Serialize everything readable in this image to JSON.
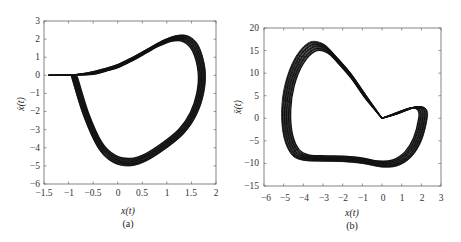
{
  "chart_data": [
    {
      "type": "line",
      "panel": "(a)",
      "caption": "(a)",
      "title": "",
      "xlabel": "x(t)",
      "ylabel": "ẋ(t)",
      "xlim": [
        -1.5,
        2
      ],
      "ylim": [
        -6,
        3
      ],
      "xticks": [
        "-1.5",
        "-1",
        "-0.5",
        "0",
        "0.5",
        "1",
        "1.5",
        "2"
      ],
      "yticks": [
        "3",
        "2",
        "1",
        "0",
        "-1",
        "-2",
        "-3",
        "-4",
        "-5",
        "-6"
      ],
      "grid": false,
      "description": "Phase portrait: trajectory starts at (-1.4, 0), runs along y=0 to about (-0.95, 0) then forms a banded chaotic-like loop reaching max ẋ≈2.3 near x≈1.3, max x≈1.8, min ẋ≈-5.1 near x≈0.25, returning to (-0.95, 0).",
      "series": [
        {
          "name": "trajectory",
          "x": [
            -1.4,
            -1.2,
            -0.95,
            -0.6,
            -0.3,
            0.0,
            0.3,
            0.6,
            0.9,
            1.2,
            1.45,
            1.65,
            1.78,
            1.75,
            1.6,
            1.35,
            1.0,
            0.6,
            0.25,
            -0.1,
            -0.4,
            -0.7,
            -0.95
          ],
          "y": [
            0.0,
            0.0,
            0.02,
            0.15,
            0.35,
            0.6,
            1.0,
            1.45,
            1.9,
            2.2,
            2.15,
            1.6,
            0.3,
            -1.0,
            -2.2,
            -3.2,
            -4.0,
            -4.7,
            -5.0,
            -4.8,
            -4.0,
            -2.2,
            0.0
          ]
        }
      ]
    },
    {
      "type": "line",
      "panel": "(b)",
      "caption": "(b)",
      "title": "",
      "xlabel": "x(t)",
      "ylabel": "ẍ(t)",
      "xlim": [
        -6,
        3
      ],
      "ylim": [
        -15,
        20
      ],
      "xticks": [
        "-6",
        "-5",
        "-4",
        "-3",
        "-2",
        "-1",
        "0",
        "1",
        "2",
        "3"
      ],
      "yticks": [
        "20",
        "15",
        "10",
        "5",
        "0",
        "-5",
        "-10",
        "-15"
      ],
      "grid": false,
      "description": "Phase portrait: banded loop from origin up-left to peak ẍ≈17 near x≈-3, down the left side to min x≈-5.2, along bottom ẍ≈-9 to -11 near x≈0.5, up the right lobe to x≈2.3 and back to origin.",
      "series": [
        {
          "name": "trajectory",
          "x": [
            0.0,
            -0.8,
            -1.6,
            -2.4,
            -3.0,
            -3.7,
            -4.4,
            -4.9,
            -5.1,
            -5.0,
            -4.6,
            -4.0,
            -3.0,
            -2.0,
            -1.0,
            0.0,
            0.8,
            1.5,
            2.0,
            2.3,
            2.25,
            1.9,
            1.4,
            0.8,
            0.0
          ],
          "y": [
            0.0,
            5.0,
            10.0,
            14.0,
            16.5,
            16.8,
            13.5,
            8.0,
            2.0,
            -4.0,
            -8.0,
            -9.3,
            -9.5,
            -9.6,
            -10.0,
            -10.8,
            -10.5,
            -8.5,
            -5.0,
            0.0,
            2.0,
            2.6,
            2.0,
            1.0,
            0.0
          ]
        }
      ]
    }
  ],
  "panels": {
    "a": {
      "caption": "(a)",
      "xlabel": "x(t)",
      "ylabel": "ẋ(t)",
      "xticks": [
        "−1.5",
        "−1",
        "−0.5",
        "0",
        "0.5",
        "1",
        "1.5",
        "2"
      ],
      "yticks": [
        "3",
        "2",
        "1",
        "0",
        "−1",
        "−2",
        "−3",
        "−4",
        "−5",
        "−6"
      ]
    },
    "b": {
      "caption": "(b)",
      "xlabel": "x(t)",
      "ylabel": "ẍ(t)",
      "xticks": [
        "−6",
        "−5",
        "−4",
        "−3",
        "−2",
        "−1",
        "0",
        "1",
        "2",
        "3"
      ],
      "yticks": [
        "20",
        "15",
        "10",
        "5",
        "0",
        "−5",
        "−10",
        "−15"
      ]
    }
  }
}
